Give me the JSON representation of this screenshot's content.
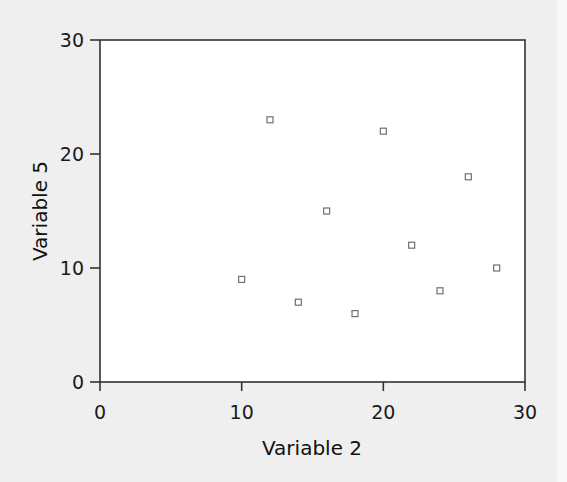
{
  "chart_data": {
    "type": "scatter",
    "title": "",
    "xlabel": "Variable 2",
    "ylabel": "Variable 5",
    "xlim": [
      0,
      30
    ],
    "ylim": [
      0,
      30
    ],
    "xticks": [
      0,
      10,
      20,
      30
    ],
    "yticks": [
      0,
      10,
      20,
      30
    ],
    "grid": false,
    "legend": null,
    "marker": "hollow-square",
    "series": [
      {
        "name": "Variable 5 vs Variable 2",
        "points": [
          {
            "x": 10,
            "y": 9
          },
          {
            "x": 12,
            "y": 23
          },
          {
            "x": 14,
            "y": 7
          },
          {
            "x": 16,
            "y": 15
          },
          {
            "x": 18,
            "y": 6
          },
          {
            "x": 20,
            "y": 22
          },
          {
            "x": 22,
            "y": 12
          },
          {
            "x": 24,
            "y": 8
          },
          {
            "x": 26,
            "y": 18
          },
          {
            "x": 28,
            "y": 10
          }
        ]
      }
    ]
  },
  "axes": {
    "x_title": "Variable 2",
    "y_title": "Variable 5",
    "x_tick_labels": [
      "0",
      "10",
      "20",
      "30"
    ],
    "y_tick_labels": [
      "0",
      "10",
      "20",
      "30"
    ]
  },
  "colors": {
    "background": "#efefef",
    "plot_area": "#ffffff",
    "axis": "#333333",
    "marker": "#707070"
  }
}
